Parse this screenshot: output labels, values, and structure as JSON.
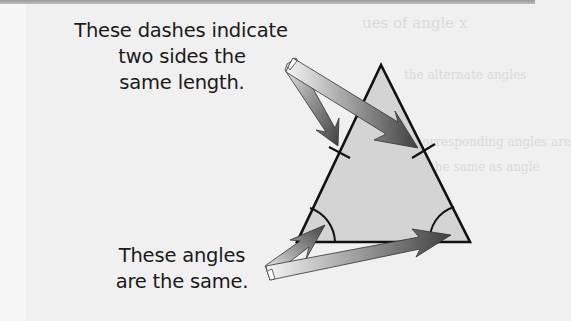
{
  "annotations": {
    "dashes": {
      "lines": [
        "These dashes indicate",
        "two sides the",
        "same length."
      ]
    },
    "angles": {
      "lines": [
        "These angles",
        "are the same."
      ]
    }
  },
  "background_ghost_text": [
    "ues of angle x",
    "the alternate angles",
    "the corresponding angles are",
    "the same as angle"
  ],
  "colors": {
    "triangle_fill": "#d4d4d4",
    "triangle_stroke": "#111111",
    "background": "#f0f0f0",
    "topbar": "#a8a8a8",
    "arrow_dark": "#4a4a4a",
    "arrow_light": "#f4f4f4"
  },
  "shapes": {
    "triangle": {
      "apex": [
        381,
        65
      ],
      "bottom_left": [
        297,
        242
      ],
      "bottom_right": [
        470,
        242
      ]
    },
    "equal_side_ticks": 2,
    "equal_angle_arcs": 2,
    "arrows": 4
  }
}
